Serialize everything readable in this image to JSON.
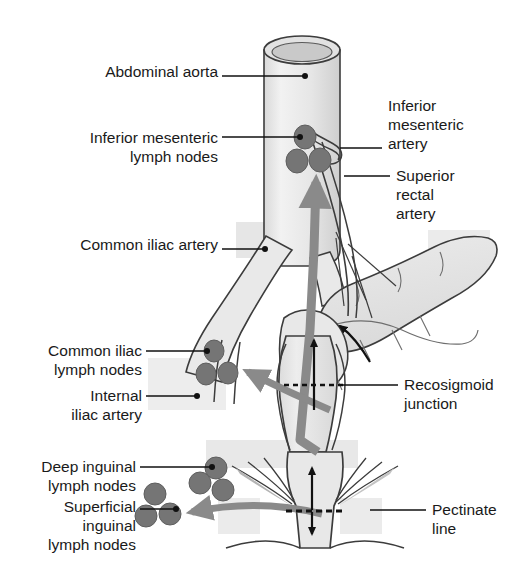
{
  "figure": {
    "kind": "anatomical-diagram",
    "background_color": "#ffffff",
    "colors": {
      "outline": "#3c3c3c",
      "organ_fill": "#ebebeb",
      "organ_fill_dark": "#dedede",
      "lymph_node": "#757575",
      "lymph_node_outline": "#5e5e5e",
      "drainage_arrow": "#8a8a8a",
      "flow_arrow": "#111111",
      "leader_line": "#111111",
      "label_text": "#1a1a1a"
    }
  },
  "labels": [
    {
      "id": "abdominal-aorta",
      "text": "Abdominal aorta",
      "side": "left",
      "x": 68,
      "y": 62,
      "width": 150,
      "align": "right",
      "leader": {
        "x1": 222,
        "y1": 76,
        "x2": 305,
        "y2": 76,
        "dot": true
      }
    },
    {
      "id": "inferior-mesenteric-lymph-nodes",
      "text": "Inferior mesenteric\nlymph nodes",
      "side": "left",
      "x": 46,
      "y": 128,
      "width": 172,
      "align": "right",
      "leader": {
        "x1": 222,
        "y1": 137,
        "x2": 300,
        "y2": 137,
        "dot": true
      }
    },
    {
      "id": "common-iliac-artery",
      "text": "Common iliac artery",
      "side": "left",
      "x": 38,
      "y": 235,
      "width": 180,
      "align": "right",
      "leader": {
        "x1": 222,
        "y1": 249,
        "x2": 265,
        "y2": 249,
        "dot": true
      }
    },
    {
      "id": "common-iliac-lymph-nodes",
      "text": "Common iliac\nlymph nodes",
      "side": "left",
      "x": 18,
      "y": 341,
      "width": 124,
      "align": "right",
      "leader": {
        "x1": 146,
        "y1": 351,
        "x2": 207,
        "y2": 351,
        "dot": true
      }
    },
    {
      "id": "internal-iliac-artery",
      "text": "Internal\niliac artery",
      "side": "left",
      "x": 30,
      "y": 386,
      "width": 112,
      "align": "right",
      "leader": {
        "x1": 146,
        "y1": 396,
        "x2": 197,
        "y2": 396,
        "dot": true
      }
    },
    {
      "id": "deep-inguinal-lymph-nodes",
      "text": "Deep inguinal\nlymph nodes",
      "side": "left",
      "x": 10,
      "y": 457,
      "width": 126,
      "align": "right",
      "leader": {
        "x1": 140,
        "y1": 467,
        "x2": 212,
        "y2": 467,
        "dot": true
      }
    },
    {
      "id": "superficial-inguinal-lymph-nodes",
      "text": "Superficial\ninguinal\nlymph nodes",
      "side": "left",
      "x": 14,
      "y": 497,
      "width": 122,
      "align": "right",
      "leader": {
        "x1": 140,
        "y1": 509,
        "x2": 176,
        "y2": 509,
        "dot": true
      }
    },
    {
      "id": "inferior-mesenteric-artery",
      "text": "Inferior\nmesenteric\nartery",
      "side": "right",
      "x": 388,
      "y": 96,
      "width": 120,
      "align": "left",
      "leader": {
        "x1": 340,
        "y1": 148,
        "x2": 382,
        "y2": 148,
        "dot": false
      }
    },
    {
      "id": "superior-rectal-artery",
      "text": "Superior\nrectal\nartery",
      "side": "right",
      "x": 396,
      "y": 166,
      "width": 116,
      "align": "left",
      "leader": {
        "x1": 344,
        "y1": 176,
        "x2": 390,
        "y2": 176,
        "dot": false
      }
    },
    {
      "id": "recosigmoid-junction",
      "text": "Recosigmoid\njunction",
      "side": "right",
      "x": 404,
      "y": 375,
      "width": 118,
      "align": "left",
      "leader": {
        "x1": 340,
        "y1": 385,
        "x2": 398,
        "y2": 385,
        "dot": false
      }
    },
    {
      "id": "pectinate-line",
      "text": "Pectinate\nline",
      "side": "right",
      "x": 432,
      "y": 500,
      "width": 92,
      "align": "left",
      "leader": {
        "x1": 370,
        "y1": 510,
        "x2": 426,
        "y2": 510,
        "dot": false
      }
    }
  ],
  "structures": {
    "aorta": "abdominal-aorta-cylinder",
    "iliac_arteries": "common-iliac-artery-branches",
    "internal_iliac": "internal-iliac-artery",
    "sigmoid_colon": "sigmoid-colon-loop",
    "rectum": "rectum-body",
    "anal_canal": "anal-canal",
    "inferior_mesenteric_artery": "inferior-mesenteric-artery",
    "superior_rectal_artery": "superior-rectal-artery"
  },
  "lymph_node_groups": [
    {
      "id": "inferior-mesenteric",
      "count": 3,
      "nodes": [
        {
          "cx": 305,
          "cy": 137,
          "rx": 11,
          "ry": 12
        },
        {
          "cx": 297,
          "cy": 161,
          "rx": 11,
          "ry": 12
        },
        {
          "cx": 320,
          "cy": 160,
          "rx": 11,
          "ry": 12
        }
      ]
    },
    {
      "id": "common-iliac",
      "count": 3,
      "nodes": [
        {
          "cx": 214,
          "cy": 351,
          "rx": 10,
          "ry": 11
        },
        {
          "cx": 206,
          "cy": 374,
          "rx": 10,
          "ry": 11
        },
        {
          "cx": 228,
          "cy": 373,
          "rx": 10,
          "ry": 11
        }
      ]
    },
    {
      "id": "deep-inguinal",
      "count": 3,
      "nodes": [
        {
          "cx": 216,
          "cy": 468,
          "rx": 11,
          "ry": 11
        },
        {
          "cx": 200,
          "cy": 483,
          "rx": 11,
          "ry": 11
        },
        {
          "cx": 223,
          "cy": 490,
          "rx": 11,
          "ry": 11
        }
      ]
    },
    {
      "id": "superficial-inguinal",
      "count": 3,
      "nodes": [
        {
          "cx": 155,
          "cy": 494,
          "rx": 11,
          "ry": 11
        },
        {
          "cx": 146,
          "cy": 516,
          "rx": 11,
          "ry": 11
        },
        {
          "cx": 170,
          "cy": 514,
          "rx": 11,
          "ry": 11
        }
      ]
    }
  ],
  "drainage_arrows": [
    {
      "id": "rectum-to-inferior-mesenteric",
      "direction": "upward",
      "description": "superior rectal drainage to inferior mesenteric nodes"
    },
    {
      "id": "rectum-to-common-iliac",
      "direction": "upper-left",
      "description": "middle rectal drainage to internal/common iliac nodes"
    },
    {
      "id": "anal-canal-to-superficial-inguinal",
      "direction": "left",
      "description": "below pectinate line drains to superficial inguinal nodes"
    }
  ],
  "flow_arrows": [
    {
      "id": "rectum-upward-flow",
      "direction": "up"
    },
    {
      "id": "sigmoid-curved-flow",
      "direction": "curved-up"
    },
    {
      "id": "pectinate-double-arrow",
      "direction": "up-down"
    }
  ],
  "reference_lines": [
    {
      "id": "recosigmoid-junction-line",
      "style": "dashed",
      "y": 385
    },
    {
      "id": "pectinate-line-marker",
      "style": "dashed",
      "y": 510
    }
  ]
}
